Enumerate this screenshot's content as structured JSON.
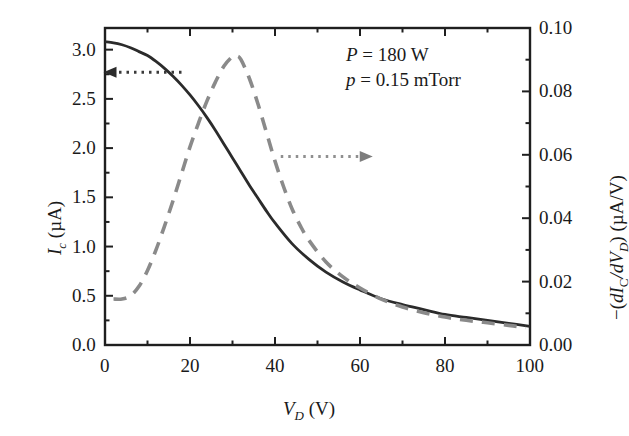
{
  "chart_data": {
    "type": "line",
    "title": "",
    "xlabel": "V_D (V)",
    "ylabel": "I_c (uA)",
    "ylabel_right": "-(dI_C/dV_D) (uA/V)",
    "xlim": [
      0,
      100
    ],
    "ylim": [
      0.0,
      3.22
    ],
    "ylim_right": [
      0.0,
      0.1
    ],
    "grid": false,
    "legend": "none",
    "x_ticks": [
      0,
      20,
      40,
      60,
      80,
      100
    ],
    "x_tick_labels": [
      "0",
      "20",
      "40",
      "60",
      "80",
      "100"
    ],
    "x_minor_ticks": [
      10,
      30,
      50,
      70,
      90
    ],
    "y_ticks_left": [
      0.0,
      0.5,
      1.0,
      1.5,
      2.0,
      2.5,
      3.0
    ],
    "y_tick_labels_left": [
      "0.0",
      "0.5",
      "1.0",
      "1.5",
      "2.0",
      "2.5",
      "3.0"
    ],
    "y_minor_ticks_left": [
      0.25,
      0.75,
      1.25,
      1.75,
      2.25,
      2.75
    ],
    "y_ticks_right": [
      0.0,
      0.02,
      0.04,
      0.06,
      0.08,
      0.1
    ],
    "y_tick_labels_right": [
      "0.00",
      "0.02",
      "0.04",
      "0.06",
      "0.08",
      "0.10"
    ],
    "y_minor_ticks_right": [
      0.01,
      0.03,
      0.05,
      0.07,
      0.09
    ],
    "series": [
      {
        "name": "Ic",
        "style": "solid",
        "color": "#2b2b2b",
        "axis": "left",
        "x": [
          0,
          2,
          4,
          6,
          8,
          10,
          12,
          14,
          16,
          18,
          20,
          22,
          24,
          26,
          28,
          30,
          32,
          34,
          36,
          38,
          40,
          44,
          48,
          52,
          56,
          60,
          65,
          70,
          75,
          80,
          85,
          90,
          95,
          100
        ],
        "y": [
          3.08,
          3.07,
          3.05,
          3.02,
          2.98,
          2.94,
          2.88,
          2.81,
          2.73,
          2.64,
          2.54,
          2.43,
          2.31,
          2.18,
          2.04,
          1.9,
          1.76,
          1.62,
          1.49,
          1.36,
          1.24,
          1.03,
          0.87,
          0.74,
          0.64,
          0.56,
          0.47,
          0.41,
          0.36,
          0.31,
          0.28,
          0.25,
          0.22,
          0.19
        ]
      },
      {
        "name": "-dIc/dVd",
        "style": "dashed",
        "color": "#8a8a8a",
        "axis": "right",
        "x": [
          2,
          4,
          6,
          8,
          10,
          12,
          14,
          16,
          18,
          20,
          22,
          24,
          26,
          28,
          30,
          31,
          32,
          34,
          36,
          38,
          40,
          42,
          44,
          46,
          48,
          52,
          56,
          60,
          65,
          70,
          75,
          80,
          85,
          90,
          95,
          99
        ],
        "y": [
          0.0145,
          0.0145,
          0.0155,
          0.0185,
          0.0235,
          0.03,
          0.0375,
          0.0455,
          0.054,
          0.0625,
          0.07,
          0.077,
          0.083,
          0.088,
          0.091,
          0.0912,
          0.09,
          0.084,
          0.076,
          0.067,
          0.058,
          0.05,
          0.043,
          0.0375,
          0.033,
          0.0262,
          0.0215,
          0.018,
          0.0145,
          0.012,
          0.0102,
          0.0088,
          0.0078,
          0.007,
          0.0062,
          0.0055
        ]
      }
    ],
    "annotations": [
      {
        "name": "power-annotation",
        "text": "P = 180 W",
        "symbol": "P",
        "value": "180",
        "unit": "W"
      },
      {
        "name": "pressure-annotation",
        "text": "p = 0.15 mTorr",
        "symbol": "p",
        "value": "0.15",
        "unit": "mTorr"
      }
    ],
    "pointer_arrows": [
      {
        "name": "left-axis-arrow",
        "direction": "left",
        "data_x": 18,
        "data_y_left": 2.77
      },
      {
        "name": "right-axis-arrow",
        "direction": "right",
        "data_x": 63,
        "data_y_right": 0.0595
      }
    ]
  },
  "labels": {
    "x_axis": {
      "symbol": "V",
      "sub": "D",
      "unit": "(V)"
    },
    "y_axis_left": {
      "symbol": "I",
      "sub": "c",
      "unit": "(µA)"
    },
    "y_axis_right": {
      "prefix": "−(",
      "d1": "d",
      "I": "I",
      "Isub": "C",
      "slash": "/",
      "d2": "d",
      "V": "V",
      "Vsub": "D",
      "suffix": ")",
      "unit": "(µA/V)"
    }
  }
}
